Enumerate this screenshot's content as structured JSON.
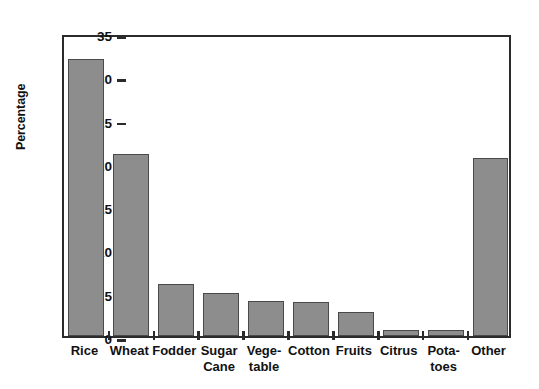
{
  "chart_data": {
    "type": "bar",
    "title": "",
    "subtitle": "",
    "xlabel": "",
    "ylabel": "Percentage",
    "ylim": [
      0,
      35
    ],
    "ytick_values": [
      0,
      5,
      10,
      15,
      20,
      25,
      30,
      35
    ],
    "ytick_labels": [
      "0",
      "5",
      "10",
      "15",
      "20",
      "25",
      "30",
      "35"
    ],
    "grid": false,
    "legend": null,
    "categories": [
      "Rice",
      "Wheat",
      "Fodder",
      "Sugar\nCane",
      "Vege-\ntable",
      "Cotton",
      "Fruits",
      "Citrus",
      "Pota-\ntoes",
      "Other"
    ],
    "values": [
      32.0,
      21.0,
      6.0,
      5.0,
      4.0,
      3.9,
      2.8,
      0.7,
      0.7,
      20.6
    ],
    "bar_color": "#8d8d8d",
    "bar_edge_color": "#4a4a4a",
    "axis_color": "#2b2b2b",
    "background_color": "#ffffff"
  }
}
